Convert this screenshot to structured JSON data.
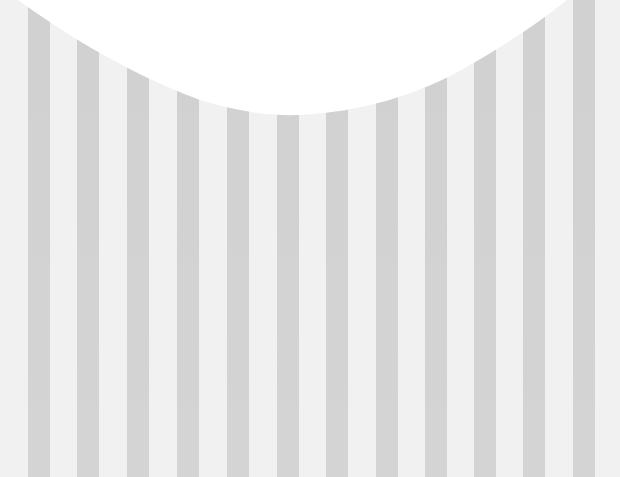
{
  "image": {
    "description": "Gray and white vertical striped paper border with a scalloped white curve along the top edge",
    "width": 620,
    "height": 477
  },
  "colors": {
    "light_stripe": "#f1f1f1",
    "dark_stripe": "#d4d4d4",
    "cutout": "#ffffff"
  },
  "stripes": [
    {
      "x": 28,
      "w": 22
    },
    {
      "x": 77,
      "w": 22
    },
    {
      "x": 127,
      "w": 22
    },
    {
      "x": 177,
      "w": 22
    },
    {
      "x": 227,
      "w": 22
    },
    {
      "x": 277,
      "w": 22
    },
    {
      "x": 326,
      "w": 22
    },
    {
      "x": 376,
      "w": 22
    },
    {
      "x": 425,
      "w": 22
    },
    {
      "x": 474,
      "w": 22
    },
    {
      "x": 523,
      "w": 22
    },
    {
      "x": 573,
      "w": 22
    }
  ],
  "scallop_curve": {
    "start": [
      20,
      0
    ],
    "lowest_point": [
      280,
      115
    ],
    "end": [
      566,
      0
    ]
  }
}
